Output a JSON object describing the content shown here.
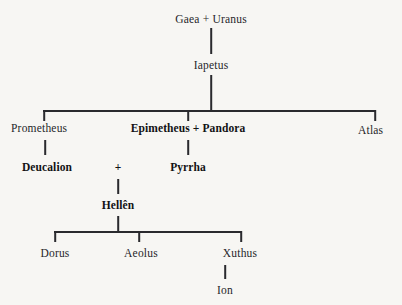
{
  "figure": {
    "nodes": {
      "gaea_uranus": "Gaea + Uranus",
      "iapetus": "Iapetus",
      "prometheus": "Prometheus",
      "epimetheus_pandora": "Epimetheus + Pandora",
      "atlas": "Atlas",
      "deucalion": "Deucalion",
      "plus": "+",
      "pyrrha": "Pyrrha",
      "hellen": "Hellên",
      "dorus": "Dorus",
      "aeolus": "Aeolus",
      "xuthus": "Xuthus",
      "ion": "Ion"
    },
    "caption": "",
    "colors": {
      "background": "#f7f6f3",
      "line": "#2a2a2e",
      "text": "#26262a",
      "text_bold": "#121214"
    }
  }
}
